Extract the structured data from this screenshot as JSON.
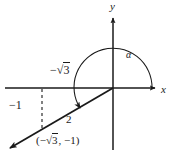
{
  "figure": {
    "axes": {
      "x_label": "x",
      "y_label": "y",
      "origin_px": [
        113,
        88
      ]
    },
    "angle": {
      "label": "α",
      "arc_direction": "counterclockwise",
      "start_deg": 0,
      "end_deg": 210
    },
    "annotations": {
      "x_coordinate_label": "−√3",
      "x_coordinate_prefix": "−",
      "x_coordinate_radicand": "3",
      "y_coordinate_label": "−1",
      "radius_label": "2",
      "point_label": "(−√3, −1)",
      "point_label_prefix": "(−",
      "point_label_radicand": "3",
      "point_label_suffix": ", −1)"
    },
    "colors": {
      "stroke": "#1a1a1a",
      "background": "#ffffff"
    }
  }
}
